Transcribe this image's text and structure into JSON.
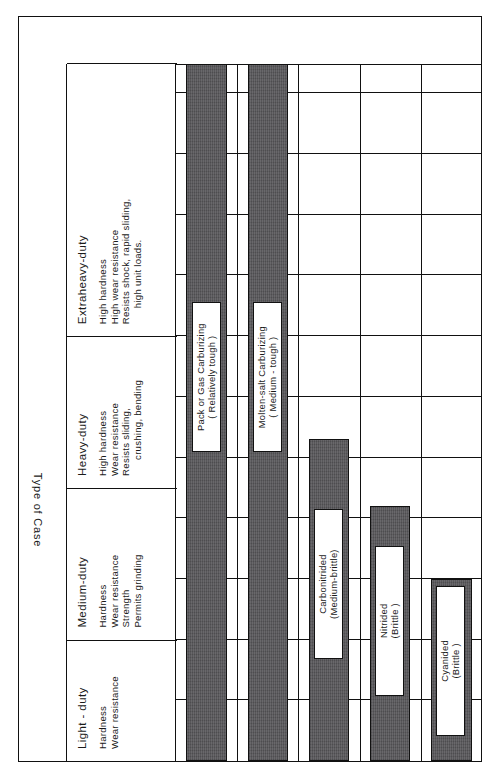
{
  "figure": {
    "value_axis_title": "Case Depth  ( inches )",
    "category_axis_title": "Type  of  Case"
  },
  "duty_classes": [
    {
      "name": "Light - duty",
      "attributes": [
        "Hardness",
        "Wear resistance"
      ]
    },
    {
      "name": "Medium-duty",
      "attributes": [
        "Hardness",
        "Wear resistance",
        "Strength",
        "Permits grinding"
      ]
    },
    {
      "name": "Heavy-duty",
      "attributes": [
        "High hardness",
        "Wear resistance",
        "Resists sliding,",
        "crushing, bending"
      ]
    },
    {
      "name": "Extraheavy-duty",
      "attributes": [
        "High hardness",
        "High wear resistance",
        "Resists shock, rapid sliding,",
        "high unit loads."
      ]
    }
  ],
  "chart_data": {
    "type": "bar",
    "orientation": "horizontal-printed-rotated",
    "title": "",
    "xlabel": "Case Depth  ( inches )",
    "ylabel": "Type  of  Case",
    "xlim": [
      0,
      0.115
    ],
    "grid": true,
    "grid_step": 0.01,
    "tick_values": [
      0.01,
      0.03,
      0.05,
      0.07,
      0.09,
      0.11
    ],
    "tick_labels": [
      "0.010",
      "0.030",
      "0.050",
      "0.070",
      "0.090",
      "0.110"
    ],
    "categories": [
      "Pack or Gas Carburizing ( Relatively tough )",
      "Molten-salt Carburizing ( Medium-tough )",
      "Carbonitrided (Medium-brittle)",
      "Nitrided (Brittle )",
      "Cyanided (Brittle )"
    ],
    "values": [
      0.115,
      0.115,
      0.053,
      0.042,
      0.03
    ],
    "bars": [
      {
        "label_line1": "Pack  or  Gas  Carburizing",
        "label_line2": "( Relatively  tough )",
        "start": 0.0,
        "end": 0.115,
        "exceeds_axis": true
      },
      {
        "label_line1": "Molten-salt  Carburizing",
        "label_line2": "( Medium - tough )",
        "start": 0.0,
        "end": 0.115,
        "exceeds_axis": true
      },
      {
        "label_line1": "Carbonitrided",
        "label_line2": "(Medium-brittle)",
        "start": 0.0,
        "end": 0.053,
        "exceeds_axis": false
      },
      {
        "label_line1": "Nitrided",
        "label_line2": "(Brittle )",
        "start": 0.0,
        "end": 0.042,
        "exceeds_axis": false
      },
      {
        "label_line1": "Cyanided",
        "label_line2": "(Brittle )",
        "start": 0.0,
        "end": 0.03,
        "exceeds_axis": false
      }
    ]
  },
  "colors": {
    "bar_fill": "#58575a",
    "line": "#111111",
    "background": "#ffffff"
  }
}
